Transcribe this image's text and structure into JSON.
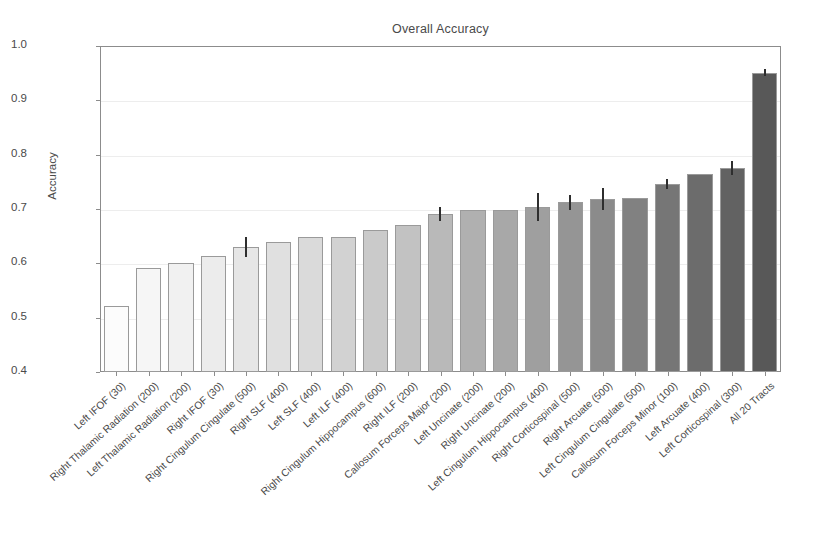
{
  "chart_data": {
    "type": "bar",
    "title": "Overall Accuracy",
    "xlabel": "",
    "ylabel": "Accuracy",
    "ylim": [
      0.4,
      1.0
    ],
    "ytick_labels": [
      "1.0",
      "0.9",
      "0.8",
      "0.7",
      "0.6",
      "0.5",
      "0.4"
    ],
    "ytick_values": [
      1.0,
      0.9,
      0.8,
      0.7,
      0.6,
      0.5,
      0.4
    ],
    "grid": true,
    "legend": "none",
    "categories": [
      "Left IFOF (30)",
      "Right Thalamic Radiation (200)",
      "Left Thalamic Radiation (200)",
      "Right IFOF (30)",
      "Right Cingulum Cingulate (500)",
      "Right SLF (400)",
      "Left SLF (400)",
      "Left ILF (400)",
      "Right Cingulum Hippocampus (600)",
      "Right ILF (200)",
      "Callosum Forceps Major (200)",
      "Left Uncinate (200)",
      "Right Uncinate (200)",
      "Left Cingulum Hippocampus (400)",
      "Right Corticospinal (500)",
      "Right Arcuate (500)",
      "Left Cingulum Cingulate (500)",
      "Callosum Forceps Minor (100)",
      "Left Arcuate (400)",
      "Left Corticospinal (300)",
      "All 20 Tracts"
    ],
    "values": [
      0.522,
      0.591,
      0.601,
      0.614,
      0.63,
      0.639,
      0.649,
      0.649,
      0.661,
      0.67,
      0.69,
      0.698,
      0.698,
      0.703,
      0.712,
      0.719,
      0.721,
      0.746,
      0.765,
      0.775,
      0.951
    ],
    "errors": [
      0,
      0,
      0,
      0,
      0.019,
      0,
      0,
      0,
      0,
      0,
      0.013,
      0,
      0,
      0.026,
      0.014,
      0.02,
      0,
      0.009,
      0,
      0.013,
      0.006
    ],
    "bar_colors": [
      "#fcfcfc",
      "#f6f6f6",
      "#f1f1f1",
      "#ececec",
      "#e6e6e6",
      "#e0e0e0",
      "#dadada",
      "#d2d2d2",
      "#cacaca",
      "#c2c2c2",
      "#b9b9b9",
      "#b0b0b0",
      "#a8a8a8",
      "#9f9f9f",
      "#959595",
      "#8b8b8b",
      "#818181",
      "#767676",
      "#6c6c6c",
      "#626262",
      "#585858"
    ]
  }
}
